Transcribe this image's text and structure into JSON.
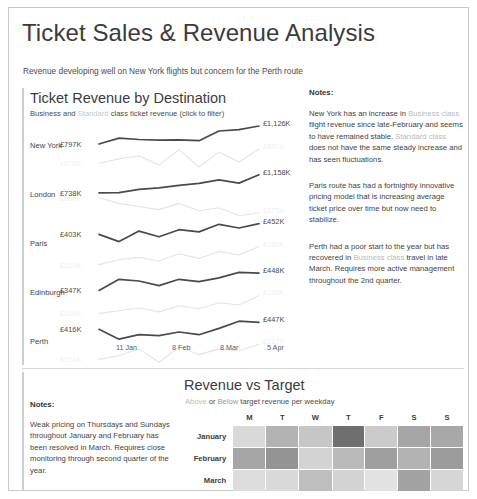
{
  "header": {
    "title": "Ticket Sales & Revenue Analysis",
    "subtitle": "Revenue developing well on New York flights but concern for the Perth route"
  },
  "lines_panel": {
    "title": "Ticket Revenue by Destination",
    "subtitle_pre": "Business and ",
    "subtitle_faint": "Standard",
    "subtitle_post": " class ticket revenue (click to filter)"
  },
  "notes_right": {
    "heading": "Notes:",
    "paragraphs": [
      {
        "p1": "New York has an increase in ",
        "h1": "Business class",
        "p2": " flight revenue since late-February and seems to have remained stable. ",
        "h2": "Standard class",
        "p3": " does not have the same steady increase and has seen fluctuations."
      },
      {
        "p1": "Paris route has had a fortnightly innovative pricing model that is increasing average ticket price over time but now need to stabilize.",
        "h1": "",
        "p2": "",
        "h2": "",
        "p3": ""
      },
      {
        "p1": "Perth had a poor start to the year but has recovered in ",
        "h1": "Business class",
        "p2": " travel in late March. Requires more active management throughout the 2nd quarter.",
        "h2": "",
        "p3": ""
      }
    ]
  },
  "bottom_panel": {
    "title": "Revenue vs Target",
    "sub_above": "Above",
    "sub_mid": " or ",
    "sub_below": "Below",
    "sub_post": " target revenue per weekday",
    "notes_heading": "Notes:",
    "notes_body": "Weak pricing on Thursdays and Sundays throughout January and February has been resolved in March. Requires close monitoring through second quarter of the year."
  },
  "chart_data": [
    {
      "type": "line",
      "title": "Ticket Revenue by Destination",
      "subtitle": "Business and Standard class ticket revenue (click to filter)",
      "xlabel": "",
      "ylabel": "",
      "x_ticks": [
        "11 Jan",
        "8 Feb",
        "8 Mar",
        "5 Apr"
      ],
      "legend": [
        "Business",
        "Standard"
      ],
      "legend_position": "subtitle-inline",
      "grid": false,
      "panels": [
        {
          "destination": "New York",
          "series": [
            {
              "name": "Business",
              "color": "#4a4a4a",
              "start_label": "£797K",
              "end_label": "£1,126K",
              "values": [
                797,
                905,
                880,
                866,
                872,
                858,
                1035,
                1060,
                1126
              ]
            },
            {
              "name": "Standard",
              "color": "#e4e4e4",
              "start_label": "£578K",
              "end_label": "£601K",
              "values": [
                578,
                585,
                590,
                575,
                600,
                572,
                596,
                580,
                601
              ]
            }
          ]
        },
        {
          "destination": "London",
          "series": [
            {
              "name": "Business",
              "color": "#4a4a4a",
              "start_label": "£738K",
              "end_label": "£1,158K",
              "values": [
                738,
                742,
                820,
                855,
                910,
                960,
                1040,
                965,
                1158
              ]
            },
            {
              "name": "Standard",
              "color": "#e4e4e4",
              "start_label": "£599K",
              "end_label": "£575K",
              "values": [
                599,
                590,
                585,
                580,
                590,
                578,
                583,
                570,
                575
              ]
            }
          ]
        },
        {
          "destination": "Paris",
          "series": [
            {
              "name": "Business",
              "color": "#4a4a4a",
              "start_label": "£403K",
              "end_label": "£452K",
              "values": [
                403,
                370,
                418,
                392,
                424,
                414,
                449,
                432,
                452
              ]
            },
            {
              "name": "Standard",
              "color": "#e4e4e4",
              "start_label": "£220K",
              "end_label": "£250K",
              "values": [
                220,
                228,
                232,
                226,
                238,
                230,
                242,
                236,
                250
              ]
            }
          ]
        },
        {
          "destination": "Edinburgh",
          "series": [
            {
              "name": "Business",
              "color": "#4a4a4a",
              "start_label": "£347K",
              "end_label": "£448K",
              "values": [
                347,
                412,
                402,
                375,
                412,
                398,
                420,
                452,
                448
              ]
            },
            {
              "name": "Standard",
              "color": "#e4e4e4",
              "start_label": "£208K",
              "end_label": "£255K",
              "values": [
                208,
                215,
                222,
                212,
                228,
                220,
                236,
                230,
                255
              ]
            }
          ]
        },
        {
          "destination": "Perth",
          "series": [
            {
              "name": "Business",
              "color": "#4a4a4a",
              "start_label": "£416K",
              "end_label": "£447K",
              "values": [
                416,
                372,
                392,
                388,
                404,
                392,
                420,
                452,
                447
              ]
            },
            {
              "name": "Standard",
              "color": "#e4e4e4",
              "start_label": "£201K",
              "end_label": "£217K",
              "values": [
                201,
                205,
                212,
                198,
                214,
                206,
                212,
                210,
                217
              ]
            }
          ]
        }
      ]
    },
    {
      "type": "heatmap",
      "title": "Revenue vs Target",
      "subtitle": "Above or Below target revenue per weekday",
      "columns": [
        "M",
        "T",
        "W",
        "T",
        "F",
        "S",
        "S"
      ],
      "rows": [
        "January",
        "February",
        "March"
      ],
      "values": [
        [
          0.18,
          0.42,
          0.3,
          0.8,
          0.26,
          0.52,
          0.5
        ],
        [
          0.52,
          0.62,
          0.2,
          0.38,
          0.55,
          0.42,
          0.56
        ],
        [
          0.16,
          0.18,
          0.36,
          0.2,
          0.12,
          0.54,
          0.22
        ]
      ],
      "colors": [
        [
          "#d9d9d9",
          "#b3b3b3",
          "#c6c6c6",
          "#6f6f6f",
          "#cbcbcb",
          "#a5a5a5",
          "#a8a8a8"
        ],
        [
          "#a5a5a5",
          "#949494",
          "#d3d3d3",
          "#bababa",
          "#9f9f9f",
          "#b3b3b3",
          "#9c9c9c"
        ],
        [
          "#dcdcdc",
          "#d9d9d9",
          "#bebebe",
          "#d3d3d3",
          "#e2e2e2",
          "#a2a2a2",
          "#d6d6d6"
        ]
      ],
      "grid": true,
      "legend_position": "subtitle-inline"
    }
  ]
}
